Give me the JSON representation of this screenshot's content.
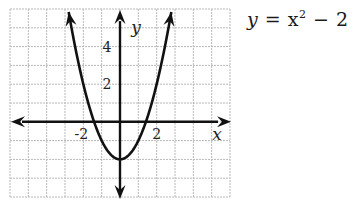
{
  "equation": {
    "lhs": "y",
    "eq": " = ",
    "base": "x",
    "exp": "2",
    "rest": " − 2"
  },
  "axes": {
    "x_label": "x",
    "y_label": "y",
    "x_ticks": [
      {
        "value": -2,
        "label": "-2"
      },
      {
        "value": 2,
        "label": "2"
      }
    ],
    "y_ticks": [
      {
        "value": 2,
        "label": "2"
      },
      {
        "value": 4,
        "label": "4"
      }
    ]
  },
  "grid": {
    "cols": 12,
    "rows": 10,
    "x_min": -6,
    "x_max": 6,
    "y_min": -4,
    "y_max": 6,
    "line_color": "#b8b8b8",
    "axis_color": "#111111"
  },
  "chart_data": {
    "type": "line",
    "function": "x^2 - 2",
    "xlabel": "x",
    "ylabel": "y",
    "xlim": [
      -6,
      6
    ],
    "ylim": [
      -4,
      6
    ],
    "grid": true,
    "x": [
      -2.8,
      -2,
      -1.414,
      -1,
      0,
      1,
      1.414,
      2,
      2.8
    ],
    "values": [
      5.84,
      2,
      0,
      -1,
      -2,
      -1,
      0,
      2,
      5.84
    ],
    "vertex": [
      0,
      -2
    ],
    "x_intercepts": [
      -1.414,
      1.414
    ],
    "y_intercept": -2,
    "x_tick_labels": [
      "-2",
      "2"
    ],
    "y_tick_labels": [
      "2",
      "4"
    ]
  }
}
